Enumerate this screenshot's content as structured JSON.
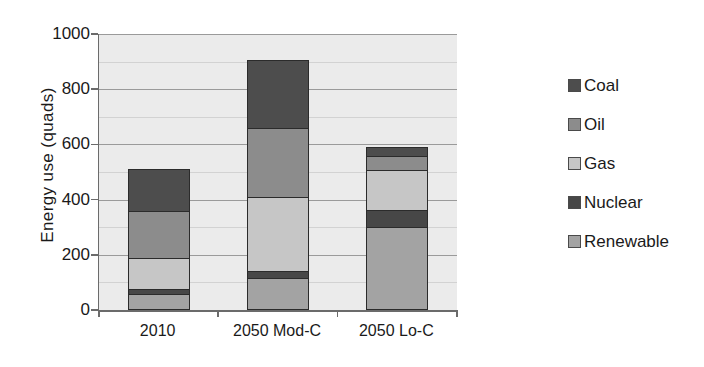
{
  "chart_data": {
    "type": "bar",
    "subtype": "stacked-bar",
    "title": "",
    "xlabel": "",
    "ylabel": "Energy use (quads)",
    "ylim": [
      0,
      1000
    ],
    "ytick_values": [
      0,
      200,
      400,
      600,
      800,
      1000
    ],
    "ytick_labels": [
      "0",
      "200",
      "400",
      "600",
      "800",
      "1000"
    ],
    "minor_gridlines": true,
    "minor_gridline_interval": 100,
    "grid": true,
    "legend_position": "right",
    "categories": [
      "2010",
      "2050 Mod-C",
      "2050 Lo-C"
    ],
    "stack_order_bottom_to_top": [
      "Renewable",
      "Nuclear",
      "Gas",
      "Oil",
      "Coal"
    ],
    "series": [
      {
        "name": "Coal",
        "color": "#4d4d4d",
        "values": [
          155,
          250,
          35
        ]
      },
      {
        "name": "Oil",
        "color": "#8c8c8c",
        "values": [
          175,
          255,
          55
        ]
      },
      {
        "name": "Gas",
        "color": "#c6c6c6",
        "values": [
          115,
          270,
          150
        ]
      },
      {
        "name": "Nuclear",
        "color": "#474747",
        "values": [
          22,
          30,
          65
        ]
      },
      {
        "name": "Renewable",
        "color": "#a3a3a3",
        "values": [
          58,
          115,
          300
        ]
      }
    ],
    "totals": [
      525,
      920,
      605
    ],
    "units": "quads"
  },
  "axis": {
    "y_title": "Energy use  (quads)"
  },
  "legend": {
    "items": [
      {
        "label": "Coal"
      },
      {
        "label": "Oil"
      },
      {
        "label": "Gas"
      },
      {
        "label": "Nuclear"
      },
      {
        "label": "Renewable"
      }
    ]
  },
  "colors": {
    "plot_background": "#ebebeb",
    "page_background": "#ffffff",
    "gridline_major": "#9a9a9a",
    "gridline_minor": "#d2d2d2",
    "axis_line": "#6b6b6b",
    "bar_outline": "#2b2b2b",
    "text": "#1a1a1a"
  }
}
